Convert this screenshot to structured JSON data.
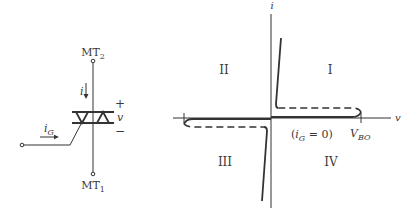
{
  "circuit": {
    "top_terminal": {
      "label": "MT",
      "subscript": "2"
    },
    "bottom_terminal": {
      "label": "MT",
      "subscript": "1"
    },
    "current_label": "i",
    "gate_current": {
      "label": "i",
      "subscript": "G"
    },
    "voltage": {
      "plus": "+",
      "label": "v",
      "minus": "−"
    }
  },
  "graph": {
    "y_axis_label": "i",
    "x_axis_label": "v",
    "quadrants": {
      "q1": "I",
      "q2": "II",
      "q3": "III",
      "q4": "IV"
    },
    "condition_label": {
      "open": "(",
      "var": "i",
      "sub": "G",
      "rest": " = 0)"
    },
    "breakover": {
      "label": "V",
      "subscript": "BO"
    }
  },
  "colors": {
    "line": "#333333",
    "text": "#3a3a3a",
    "background": "#ffffff"
  }
}
